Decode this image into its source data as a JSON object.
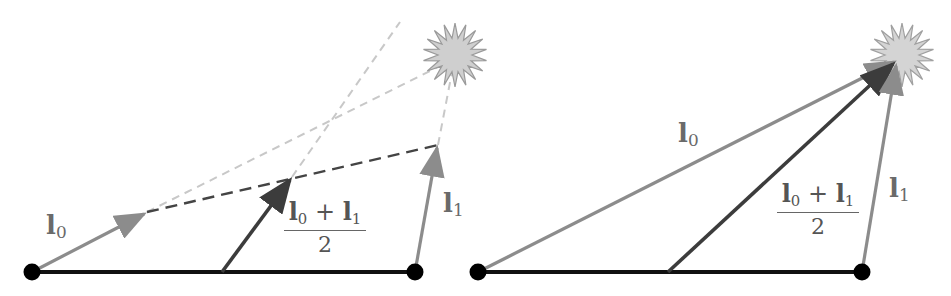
{
  "figure": {
    "colors": {
      "base_line": "#111111",
      "endpoint_dot": "#000000",
      "light_vector": "#8c8c8c",
      "average_vector": "#3c3c3c",
      "dashed_dark": "#444444",
      "dashed_light": "#c8c8c8",
      "light_source_fill": "#cfcfcf",
      "light_source_stroke": "#9a9a9a",
      "label_color": "#6a6a6a"
    },
    "panels": [
      {
        "id": "left",
        "labels": {
          "l0": {
            "base": "l",
            "sub": "0"
          },
          "l1": {
            "base": "l",
            "sub": "1"
          },
          "avg_numerator_a": {
            "base": "l",
            "sub": "0"
          },
          "avg_plus": "+",
          "avg_numerator_b": {
            "base": "l",
            "sub": "1"
          },
          "avg_denominator": "2"
        }
      },
      {
        "id": "right",
        "labels": {
          "l0": {
            "base": "l",
            "sub": "0"
          },
          "l1": {
            "base": "l",
            "sub": "1"
          },
          "avg_numerator_a": {
            "base": "l",
            "sub": "0"
          },
          "avg_plus": "+",
          "avg_numerator_b": {
            "base": "l",
            "sub": "1"
          },
          "avg_denominator": "2"
        }
      }
    ]
  }
}
